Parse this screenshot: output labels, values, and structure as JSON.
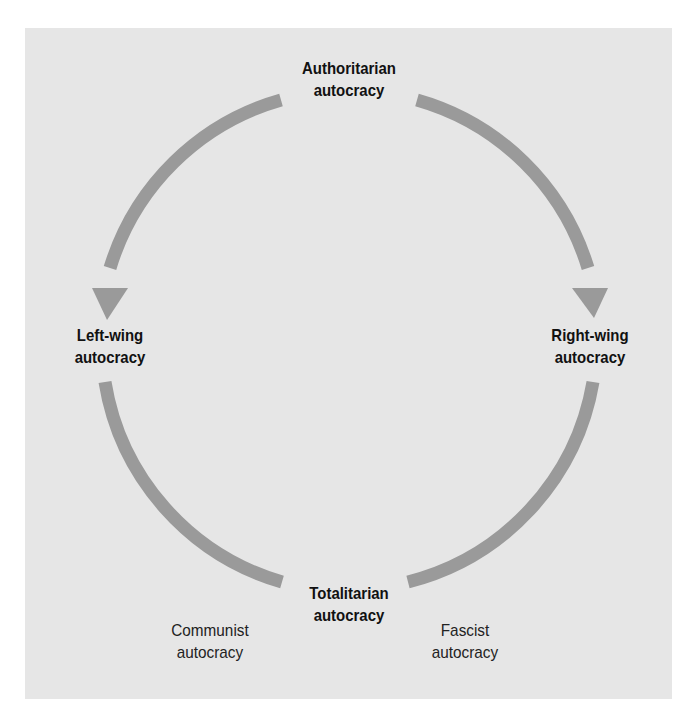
{
  "diagram": {
    "type": "cycle",
    "nodes": {
      "top": {
        "line1": "Authoritarian",
        "line2": "autocracy"
      },
      "left": {
        "line1": "Left-wing",
        "line2": "autocracy"
      },
      "right": {
        "line1": "Right-wing",
        "line2": "autocracy"
      },
      "bottom": {
        "line1": "Totalitarian",
        "line2": "autocracy"
      }
    },
    "sublabels": {
      "bottom_left": {
        "line1": "Communist",
        "line2": "autocracy"
      },
      "bottom_right": {
        "line1": "Fascist",
        "line2": "autocracy"
      }
    },
    "edges": [
      {
        "from": "Authoritarian autocracy",
        "to": "Left-wing autocracy",
        "arrow": true
      },
      {
        "from": "Authoritarian autocracy",
        "to": "Right-wing autocracy",
        "arrow": true
      },
      {
        "from": "Left-wing autocracy",
        "to": "Totalitarian autocracy",
        "arrow": false
      },
      {
        "from": "Right-wing autocracy",
        "to": "Totalitarian autocracy",
        "arrow": false
      }
    ],
    "colors": {
      "background": "#e6e6e6",
      "arc": "#9a9a9a",
      "text": "#111111"
    }
  }
}
